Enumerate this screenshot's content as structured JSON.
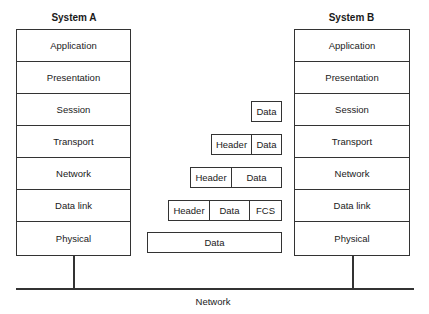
{
  "diagram": {
    "system_a": {
      "title": "System A",
      "layers": [
        "Application",
        "Presentation",
        "Session",
        "Transport",
        "Network",
        "Data link",
        "Physical"
      ]
    },
    "system_b": {
      "title": "System B",
      "layers": [
        "Application",
        "Presentation",
        "Session",
        "Transport",
        "Network",
        "Data link",
        "Physical"
      ]
    },
    "pdus": {
      "session": [
        "Data"
      ],
      "transport": [
        "Header",
        "Data"
      ],
      "network": [
        "Header",
        "Data"
      ],
      "data_link": [
        "Header",
        "Data",
        "FCS"
      ],
      "physical": [
        "Data"
      ]
    },
    "network_label": "Network"
  }
}
